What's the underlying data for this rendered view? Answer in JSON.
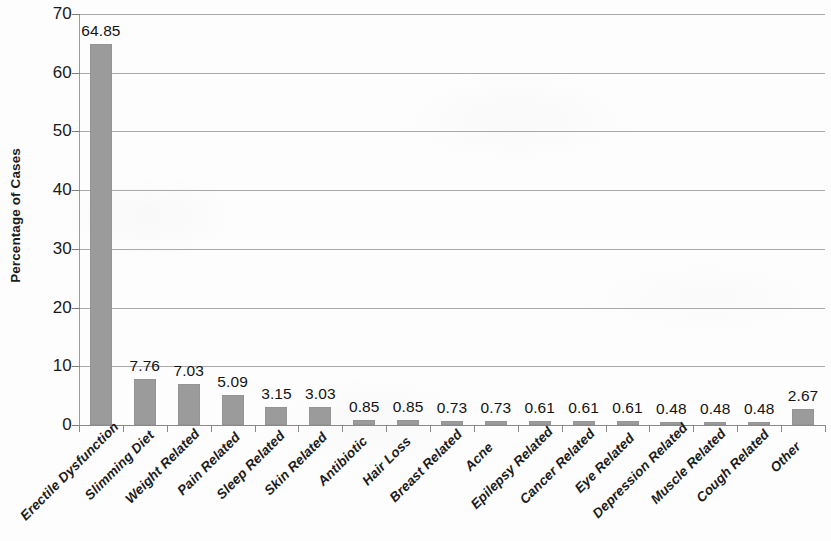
{
  "chart_data": {
    "type": "bar",
    "title": "",
    "xlabel": "",
    "ylabel": "Percentage of Cases",
    "ylim": [
      0,
      70
    ],
    "y_ticks": [
      0,
      10,
      20,
      30,
      40,
      50,
      60,
      70
    ],
    "y_tick_labels": [
      "0",
      "10",
      "20",
      "30",
      "40",
      "50",
      "60",
      "70"
    ],
    "grid": true,
    "legend": "none",
    "bar_color": "#9b9b9b",
    "categories": [
      "Erectile Dysfunction",
      "Slimming Diet",
      "Weight Related",
      "Pain Related",
      "Sleep Related",
      "Skin Related",
      "Antibiotic",
      "Hair Loss",
      "Breast Related",
      "Acne",
      "Epilepsy Related",
      "Cancer Related",
      "Eye Related",
      "Depression Related",
      "Muscle Related",
      "Cough Related",
      "Other"
    ],
    "values": [
      64.85,
      7.76,
      7.03,
      5.09,
      3.15,
      3.03,
      0.85,
      0.85,
      0.73,
      0.73,
      0.61,
      0.61,
      0.61,
      0.48,
      0.48,
      0.48,
      2.67
    ],
    "value_labels": [
      "64.85",
      "7.76",
      "7.03",
      "5.09",
      "3.15",
      "3.03",
      "0.85",
      "0.85",
      "0.73",
      "0.73",
      "0.61",
      "0.61",
      "0.61",
      "0.48",
      "0.48",
      "0.48",
      "2.67"
    ]
  }
}
